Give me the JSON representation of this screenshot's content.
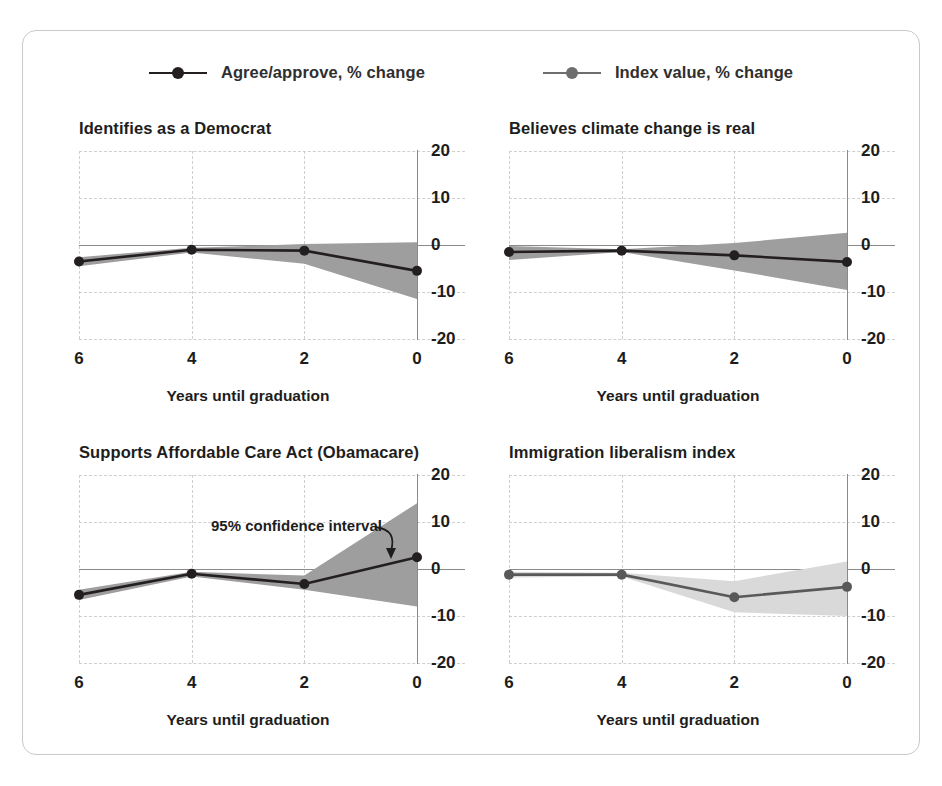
{
  "legend": {
    "items": [
      {
        "label": "Agree/approve, % change",
        "color": "#231f20",
        "marker": "line-dot-marker"
      },
      {
        "label": "Index value, % change",
        "color": "#6e6e6e",
        "marker": "line-dot-marker"
      }
    ]
  },
  "axis": {
    "xlabel": "Years until graduation",
    "xticks": [
      "6",
      "4",
      "2",
      "0"
    ],
    "yticks": [
      "20",
      "10",
      "0",
      "-10",
      "-20"
    ]
  },
  "annotation": {
    "text": "95% confidence interval"
  },
  "chart_data": {
    "type": "line",
    "title": "",
    "xlabel": "Years until graduation",
    "ylabel": "",
    "xlim": [
      6,
      0
    ],
    "ylim": [
      -20,
      20
    ],
    "x": [
      6,
      4,
      2,
      0
    ],
    "xticks": [
      6,
      4,
      2,
      0
    ],
    "yticks": [
      20,
      10,
      0,
      -10,
      -20
    ],
    "grid": true,
    "legend_position": "top-center",
    "annotations": [
      {
        "text": "95% confidence interval",
        "panel": 2,
        "points_to": "confidence band near x=0"
      }
    ],
    "panels": [
      {
        "title": "Identifies as a Democrat",
        "series_name": "Agree/approve, % change",
        "color": "#231f20",
        "band_color": "#9e9e9e",
        "values": [
          -3.5,
          -1.0,
          -1.2,
          -5.5
        ],
        "band_lower": [
          -4.5,
          -1.6,
          -4.0,
          -11.5
        ],
        "band_upper": [
          -2.6,
          -0.6,
          0.2,
          0.6
        ]
      },
      {
        "title": "Believes climate change is real",
        "series_name": "Agree/approve, % change",
        "color": "#231f20",
        "band_color": "#9e9e9e",
        "values": [
          -1.5,
          -1.2,
          -2.2,
          -3.6
        ],
        "band_lower": [
          -3.2,
          -1.5,
          -5.4,
          -9.6
        ],
        "band_upper": [
          -0.2,
          -0.9,
          0.4,
          2.6
        ]
      },
      {
        "title": "Supports Affordable Care Act (Obamacare)",
        "series_name": "Agree/approve, % change",
        "color": "#231f20",
        "band_color": "#9e9e9e",
        "values": [
          -5.5,
          -1.0,
          -3.2,
          2.5
        ],
        "band_lower": [
          -6.6,
          -1.6,
          -4.4,
          -8.0
        ],
        "band_upper": [
          -4.4,
          -0.6,
          -1.4,
          14.0
        ]
      },
      {
        "title": "Immigration liberalism index",
        "series_name": "Index value, % change",
        "color": "#595959",
        "band_color": "#d9d9d9",
        "values": [
          -1.2,
          -1.2,
          -6.0,
          -3.8
        ],
        "band_lower": [
          -1.8,
          -1.6,
          -9.2,
          -10.0
        ],
        "band_upper": [
          -0.6,
          -0.8,
          -2.6,
          1.6
        ]
      }
    ]
  }
}
